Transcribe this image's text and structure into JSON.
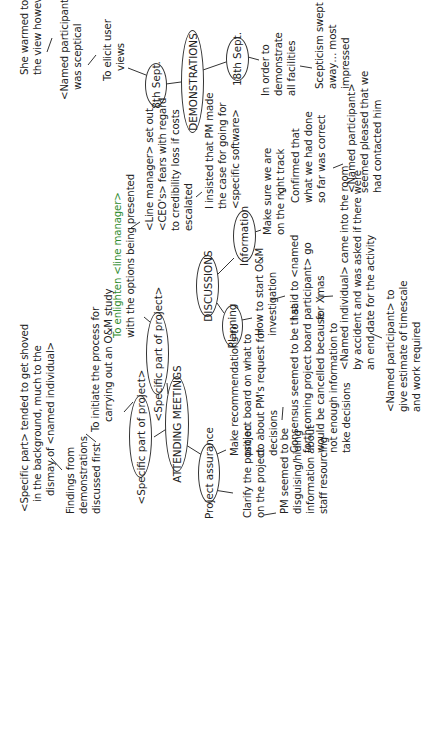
{
  "diagram": {
    "type": "mind-map",
    "orientation": "rotated-90-ccw",
    "nodes": {
      "demonstrations": "DEMONSTRATIONS",
      "sept8": "8th Sept.",
      "sept18": "18th Sept.",
      "discussions": "DISCUSSIONS",
      "information": "Information",
      "planning": "Planning",
      "attending_meetings": "ATTENDING MEETINGS",
      "specific_part_top": "<Specific part of project>",
      "specific_part_left": "<Specific part of project>",
      "project_assurance": "Project assurance"
    },
    "notes": {
      "she_warmed": [
        "She warmed to",
        "the view however"
      ],
      "was_sceptical": [
        "<Named participant>",
        "was sceptical"
      ],
      "elicit_views": [
        "To elicit user",
        "views"
      ],
      "demonstrate_facilities": [
        "In order to",
        "demonstrate",
        "all facilities"
      ],
      "scepticism_swept": [
        "Scepticism swept",
        "away… most",
        "impressed"
      ],
      "line_manager_fears": [
        "<Line manager> set out",
        "<CEO's> fears with regard",
        "to credibility loss if costs",
        "escalated"
      ],
      "pm_made_case": [
        "I insisted that PM made",
        "the case for going for",
        "<specific software>"
      ],
      "right_track": [
        "Make sure we are",
        "on the right track"
      ],
      "confirmed": [
        "Confirmed that",
        "what we had done",
        "so far was correct"
      ],
      "seemed_pleased": [
        "<Named participant>",
        "seemed pleased that we",
        "had contacted him"
      ],
      "enlighten": [
        "To enlighten <line manager>",
        "with the options being presented"
      ],
      "start_om": [
        "How to start O&M",
        "investigation"
      ],
      "go_for_xmas": [
        "I said to <named",
        "participant> go",
        "for Xmas"
      ],
      "came_into_room": [
        "<Named individual> came into the room",
        "by accident and was asked if there were",
        "an end date for the activity"
      ],
      "give_estimate": [
        "<Named participant> to",
        "give estimate of timescale",
        "and work required"
      ],
      "recommendations": [
        "Make recommendations to",
        "project board on what to",
        "do about PM's request for",
        "decisions"
      ],
      "consensus": [
        "Consensus seemed to be that",
        "forthcoming project board",
        "would be cancelled because",
        "not enough information to",
        "take decisions"
      ],
      "clarify_position": [
        "Clarify the position",
        "on the project"
      ],
      "pm_disguising": [
        "PM seemed to be",
        "disguising/hiding",
        "information about",
        "staff resourcing"
      ],
      "shoved": [
        "<Specific part> tended to get shoved",
        "in the background, much to the",
        "dismay of <named individual>"
      ],
      "findings": [
        "Findings from",
        "demonstrations",
        "discussed first"
      ],
      "initiate_process": [
        "To initiate the process for",
        "carrying out an O&M study"
      ]
    },
    "colors": {
      "line": "#333333",
      "text": "#222222",
      "accent_green": "#2e8b2e",
      "accent_red": "#c0392b"
    }
  }
}
